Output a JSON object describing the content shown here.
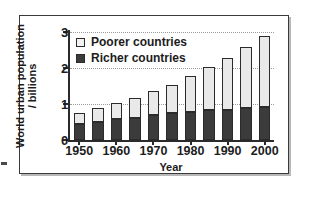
{
  "figure": {
    "frame_color": "#3a3a3a",
    "background": "#ffffff"
  },
  "legend": {
    "position": "inside-top-left",
    "entries": [
      {
        "label": "Poorer countries",
        "swatch": "legend-swatch-poorer",
        "color": "#f2f2f2"
      },
      {
        "label": "Richer countries",
        "swatch": "legend-swatch-richer",
        "color": "#3b3b3b"
      }
    ]
  },
  "chart_data": {
    "type": "bar",
    "stacked": true,
    "title": "",
    "xlabel": "Year",
    "ylabel": "World urban population / billions",
    "ylabel_lines": [
      "World urban population",
      "/ billions"
    ],
    "grid": true,
    "ylim": [
      0,
      3.2
    ],
    "yticks": [
      0,
      1,
      2,
      3
    ],
    "ytick_labels": [
      "0",
      "1",
      "2",
      "3"
    ],
    "xticks": [
      1950,
      1960,
      1970,
      1980,
      1990,
      2000
    ],
    "xtick_labels": [
      "1950",
      "1960",
      "1970",
      "1980",
      "1990",
      "2000"
    ],
    "categories": [
      1950,
      1955,
      1960,
      1965,
      1970,
      1975,
      1980,
      1985,
      1990,
      1995,
      2000
    ],
    "series": [
      {
        "name": "Richer countries",
        "color": "#3b3b3b",
        "values": [
          0.45,
          0.51,
          0.57,
          0.62,
          0.69,
          0.75,
          0.78,
          0.82,
          0.84,
          0.89,
          0.92
        ]
      },
      {
        "name": "Poorer countries",
        "color": "#e9e9e9",
        "values": [
          0.29,
          0.37,
          0.45,
          0.54,
          0.66,
          0.78,
          1.0,
          1.2,
          1.45,
          1.68,
          1.96
        ]
      }
    ],
    "totals": [
      0.74,
      0.88,
      1.02,
      1.16,
      1.35,
      1.53,
      1.78,
      2.02,
      2.29,
      2.57,
      2.88
    ],
    "units": "billions"
  }
}
